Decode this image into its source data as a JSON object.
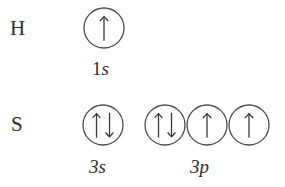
{
  "diagram": {
    "line_color": "#4a4a4a",
    "text_color": "#2e2e2e",
    "background_color": "#ffffff",
    "rows": [
      {
        "element": "H",
        "element_name": "hydrogen-row",
        "groups": [
          {
            "subshell": "1s",
            "principal": "1",
            "letter": "s",
            "boxes": [
              {
                "arrows": [
                  "up"
                ]
              }
            ]
          }
        ]
      },
      {
        "element": "S",
        "element_name": "sulfur-row",
        "groups": [
          {
            "subshell": "3s",
            "principal": "3",
            "letter": "s",
            "boxes": [
              {
                "arrows": [
                  "up",
                  "down"
                ]
              }
            ]
          },
          {
            "subshell": "3p",
            "principal": "3",
            "letter": "p",
            "boxes": [
              {
                "arrows": [
                  "up",
                  "down"
                ]
              },
              {
                "arrows": [
                  "up"
                ]
              },
              {
                "arrows": [
                  "up"
                ]
              }
            ]
          }
        ]
      }
    ]
  },
  "labels": {
    "element_h": "H",
    "element_s": "S",
    "subshell_1s_principal": "1",
    "subshell_1s_letter": "s",
    "subshell_3s_principal": "3",
    "subshell_3s_letter": "s",
    "subshell_3p_principal": "3",
    "subshell_3p_letter": "p"
  }
}
